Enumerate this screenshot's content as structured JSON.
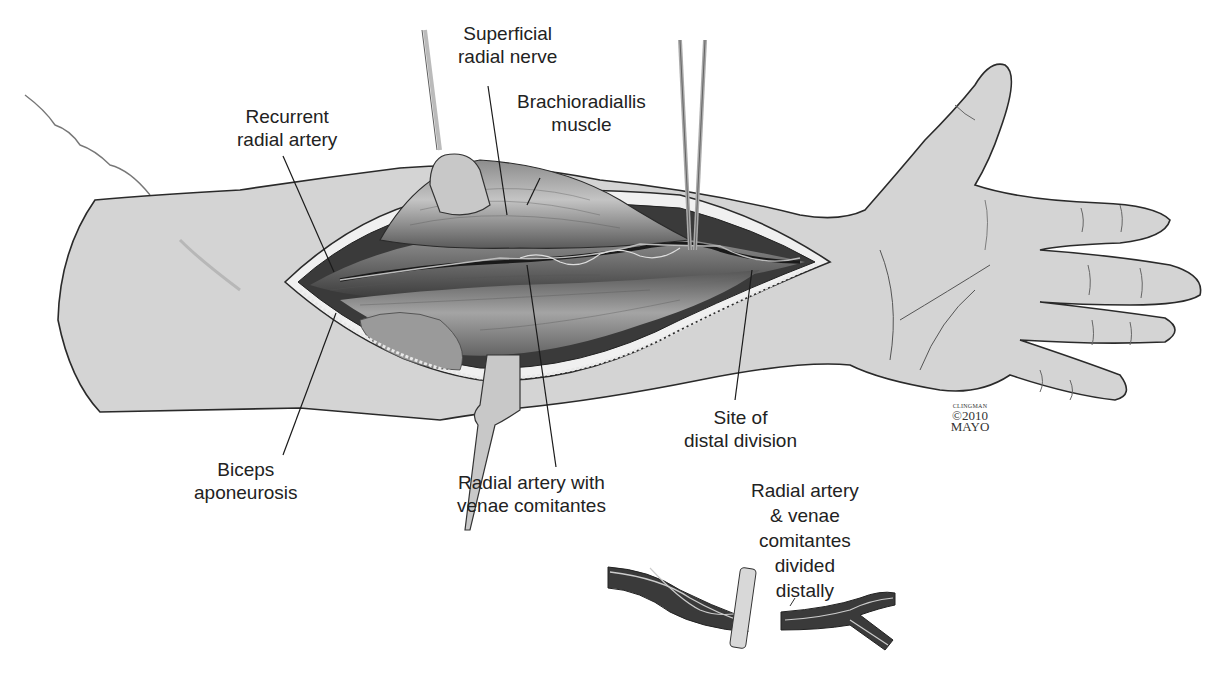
{
  "figure": {
    "type": "surgical anatomical illustration",
    "colors": {
      "skin": "#d4d4d4",
      "outline": "#2a2a2a",
      "muscle_dark": "#4a4a4a",
      "muscle_mid": "#7a7a7a",
      "retractor": "#c8c8c8",
      "fat_edge": "#eeeeee",
      "label_text": "#222222"
    }
  },
  "labels": {
    "superficial_radial_nerve": {
      "lines": [
        "Superficial",
        "radial nerve"
      ]
    },
    "brachioradialis_muscle": {
      "lines": [
        "Brachioradiallis",
        "muscle"
      ]
    },
    "recurrent_radial_artery": {
      "lines": [
        "Recurrent",
        "radial artery"
      ]
    },
    "biceps_aponeurosis": {
      "lines": [
        "Biceps",
        "aponeurosis"
      ]
    },
    "radial_artery_with_venae": {
      "lines": [
        "Radial artery with",
        "venae comitantes"
      ]
    },
    "site_of_distal_division": {
      "lines": [
        "Site of",
        "distal division"
      ]
    },
    "radial_artery_divided": {
      "lines": [
        "Radial artery",
        "& venae",
        "comitantes",
        "divided",
        "distally"
      ]
    }
  },
  "copyright": {
    "artist": "CLINGMAN",
    "year": "©2010",
    "org": "MAYO"
  }
}
